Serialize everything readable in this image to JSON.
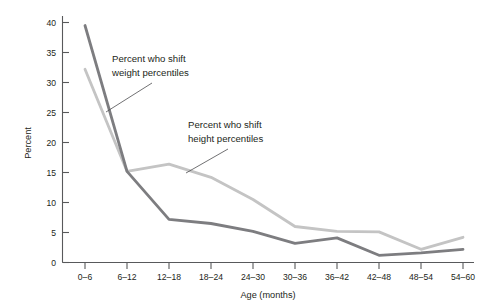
{
  "chart_data": {
    "type": "line",
    "title": "",
    "xlabel": "Age (months)",
    "ylabel": "Percent",
    "categories": [
      "0–6",
      "6–12",
      "12–18",
      "18–24",
      "24–30",
      "30–36",
      "36–42",
      "42–48",
      "48–54",
      "54–60"
    ],
    "ylim": [
      0,
      40
    ],
    "yticks": [
      0,
      5,
      10,
      15,
      20,
      25,
      30,
      35,
      40
    ],
    "ytick_labels": [
      "0",
      "5",
      "10",
      "15",
      "20",
      "25",
      "30",
      "35",
      "40"
    ],
    "grid": false,
    "legend": "annotations",
    "series": [
      {
        "name": "Percent who shift weight percentiles",
        "color": "#7d7d80",
        "values": [
          39.5,
          15.2,
          7.2,
          6.5,
          5.2,
          3.2,
          4.1,
          1.2,
          1.6,
          2.2
        ]
      },
      {
        "name": "Percent who shift height percentiles",
        "color": "#c4c4c4",
        "values": [
          32.2,
          15.2,
          16.4,
          14.2,
          10.5,
          6.0,
          5.2,
          5.1,
          2.2,
          4.2
        ]
      }
    ],
    "annotations": [
      {
        "id": "weight-annotation",
        "line1": "Percent who shift",
        "line2": "weight percentiles",
        "text": "Percent who shift weight percentiles"
      },
      {
        "id": "height-annotation",
        "line1": "Percent who shift",
        "line2": "height percentiles",
        "text": "Percent who shift height percentiles"
      }
    ]
  },
  "colors": {
    "axis": "#58595b",
    "text": "#231f20",
    "weight_series": "#7d7d80",
    "height_series": "#c4c4c4",
    "background": "#ffffff"
  }
}
